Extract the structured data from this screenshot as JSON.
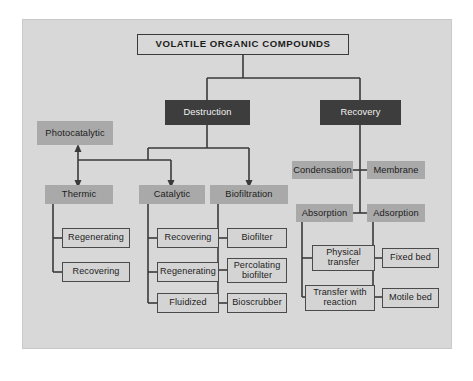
{
  "diagram": {
    "title": "VOLATILE ORGANIC COMPOUNDS",
    "panel_background": "#d8d8d8",
    "colors": {
      "dark_box": "#3d3d3d",
      "gray_box": "#a9a9a9",
      "light_box": "#d4d4d4",
      "line": "#3a3a3a",
      "panel": "#d8d8d8",
      "page": "#ffffff"
    },
    "branches": {
      "destruction": "Destruction",
      "recovery": "Recovery"
    },
    "destruction_children": {
      "photocatalytic": "Photocatalytic",
      "thermic": "Thermic",
      "catalytic": "Catalytic",
      "biofiltration": "Biofiltration"
    },
    "thermic_children": [
      "Regenerating",
      "Recovering"
    ],
    "catalytic_children": [
      "Recovering",
      "Regenerating",
      "Fluidized"
    ],
    "biofiltration_children": [
      "Biofilter",
      "Percolating biofilter",
      "Bioscrubber"
    ],
    "recovery_children": {
      "condensation": "Condensation",
      "membrane": "Membrane",
      "absorption": "Absorption",
      "adsorption": "Adsorption"
    },
    "absorption_children": [
      "Physical transfer",
      "Transfer with reaction"
    ],
    "adsorption_children": [
      "Fixed bed",
      "Motile bed"
    ]
  }
}
